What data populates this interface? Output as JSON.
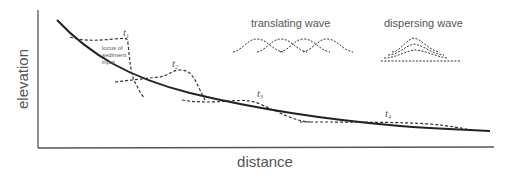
{
  "axes": {
    "xlabel": "distance",
    "ylabel": "elevation"
  },
  "annotations": {
    "locus": [
      "locus of",
      "sediment",
      "input"
    ],
    "time_labels": [
      {
        "t": "t",
        "sub": "1"
      },
      {
        "t": "t",
        "sub": "2"
      },
      {
        "t": "t",
        "sub": "3"
      },
      {
        "t": "t",
        "sub": "4"
      }
    ],
    "legend": {
      "translating": "translating wave",
      "dispersing": "dispersing wave"
    }
  },
  "colors": {
    "profile": "#222222",
    "dashed": "#333333",
    "axis": "#555555",
    "text": "#555555"
  }
}
